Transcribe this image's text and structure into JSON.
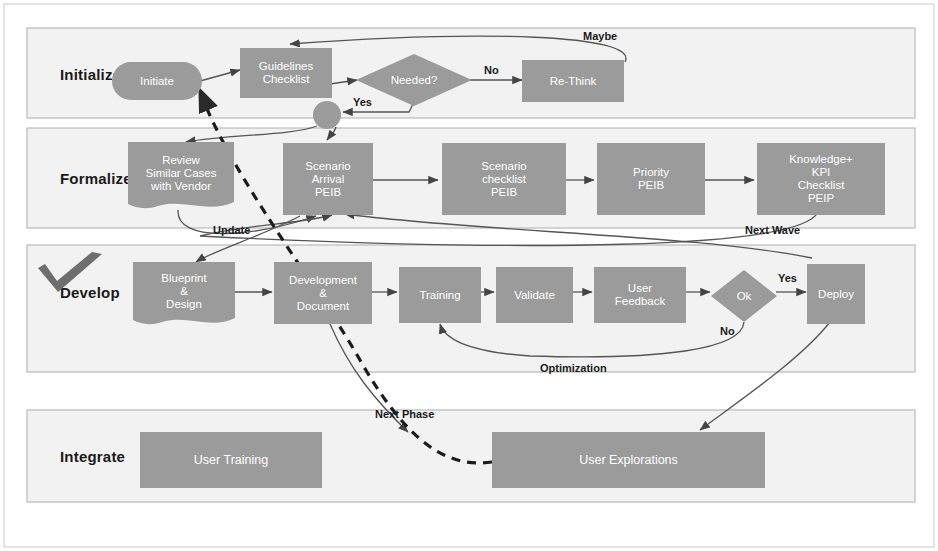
{
  "diagram": {
    "colors": {
      "node_fill": "#9b9b9b",
      "node_fill_dark": "#8f8f8f",
      "band_fill": "#f2f2f2",
      "band_border": "#b5b5b5",
      "line": "#555555",
      "text_light": "#ffffff",
      "text_dark": "#1a1a1a",
      "check_icon": "#6b6b6b"
    },
    "bands": [
      {
        "id": "initialize",
        "label": "Initialize",
        "has_check_icon": false
      },
      {
        "id": "formalize",
        "label": "Formalize",
        "has_check_icon": false
      },
      {
        "id": "develop",
        "label": "Develop",
        "has_check_icon": true
      },
      {
        "id": "integrate",
        "label": "Integrate",
        "has_check_icon": false
      }
    ],
    "nodes": {
      "initiate": {
        "label": "Initiate",
        "shape": "pill"
      },
      "guidelines_checklist": {
        "label": "Guidelines\nChecklist",
        "shape": "rect"
      },
      "needed": {
        "label": "Needed?",
        "shape": "diamond"
      },
      "rethink": {
        "label": "Re-Think",
        "shape": "rect"
      },
      "junction": {
        "label": "",
        "shape": "circle"
      },
      "review_similar_cases": {
        "label": "Review\nSimilar Cases\nwith Vendor",
        "shape": "document"
      },
      "scenario_arrival": {
        "label": "Scenario\nArrival\nPEIB",
        "shape": "rect"
      },
      "scenario_checklist": {
        "label": "Scenario\nchecklist\nPEIB",
        "shape": "rect"
      },
      "priority_peib": {
        "label": "Priority\nPEIB",
        "shape": "rect"
      },
      "knowledge_kpi": {
        "label": "Knowledge+\nKPI\nChecklist\nPEIP",
        "shape": "rect"
      },
      "blueprint_design": {
        "label": "Blueprint\n&\nDesign",
        "shape": "document"
      },
      "development_document": {
        "label": "Development\n&\nDocument",
        "shape": "rect"
      },
      "training": {
        "label": "Training",
        "shape": "rect"
      },
      "validate": {
        "label": "Validate",
        "shape": "rect"
      },
      "user_feedback": {
        "label": "User\nFeedback",
        "shape": "rect"
      },
      "ok": {
        "label": "Ok",
        "shape": "diamond"
      },
      "deploy": {
        "label": "Deploy",
        "shape": "rect"
      },
      "user_training": {
        "label": "User Training",
        "shape": "rect"
      },
      "user_explorations": {
        "label": "User Explorations",
        "shape": "rect"
      }
    },
    "edge_labels": {
      "maybe": "Maybe",
      "no_needed": "No",
      "yes_needed": "Yes",
      "update": "Update",
      "next_wave": "Next Wave",
      "yes_ok": "Yes",
      "no_ok": "No",
      "optimization": "Optimization",
      "next_phase": "Next Phase"
    },
    "icons": {
      "check": "check-icon"
    }
  }
}
